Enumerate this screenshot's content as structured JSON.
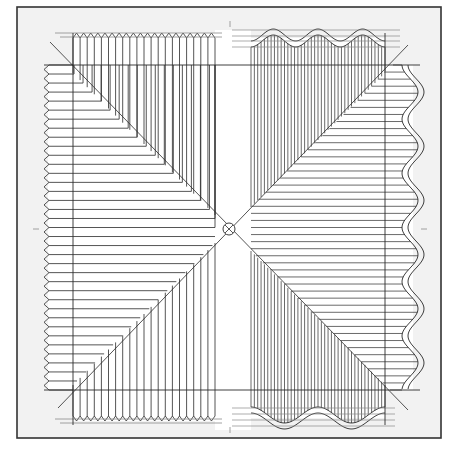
{
  "drawing": {
    "title": "",
    "description": "Orthographic construction drawing: pleated (zigzag) surface on left/top-left projection and corrugated (wavy) sheet on right/bottom-right, projected through 45-degree diagonals around a central point.",
    "colors": {
      "paper": "#f2f2f2",
      "frame": "#333333",
      "line": "#2a2a2a",
      "hatch_light": "#8a8a8a",
      "white_band": "#ffffff"
    },
    "frame": {
      "x": 17,
      "y": 7,
      "width": 424,
      "height": 431
    },
    "center": {
      "x": 229,
      "y": 229,
      "r": 6
    },
    "reference_lines": {
      "vertical": [
        73,
        385
      ],
      "horizontal": [
        65,
        390
      ]
    },
    "white_band": {
      "x": 215,
      "y": 30,
      "width": 36,
      "height": 400
    },
    "left_panel": {
      "type": "zigzag-pleat",
      "edge_x": 44,
      "y_start": 65,
      "y_end": 390,
      "line_count": 36
    },
    "top_left_pleat": {
      "type": "zigzag-pleat",
      "edge_y": 33,
      "x_start": 73,
      "x_end": 215,
      "line_count": 20
    },
    "bottom_left_pleat": {
      "type": "zigzag-pleat",
      "edge_y": 421,
      "x_start": 73,
      "x_end": 215,
      "line_count": 20
    },
    "top_right_wave": {
      "type": "corrugated",
      "y": 38,
      "x_start": 251,
      "x_end": 385,
      "waves": 3,
      "amplitude": 6
    },
    "right_wave": {
      "type": "corrugated",
      "x": 413,
      "y_start": 65,
      "y_end": 390,
      "waves": 6,
      "amplitude": 8
    },
    "bottom_right_wave": {
      "type": "corrugated",
      "y": 418,
      "x_start": 251,
      "x_end": 385,
      "waves": 2,
      "amplitude": 8
    },
    "tick_marks": [
      {
        "x": 230,
        "y": 24,
        "orient": "vertical"
      },
      {
        "x": 36,
        "y": 229,
        "orient": "horizontal"
      },
      {
        "x": 424,
        "y": 229,
        "orient": "horizontal"
      },
      {
        "x": 230,
        "y": 430,
        "orient": "vertical"
      }
    ]
  }
}
